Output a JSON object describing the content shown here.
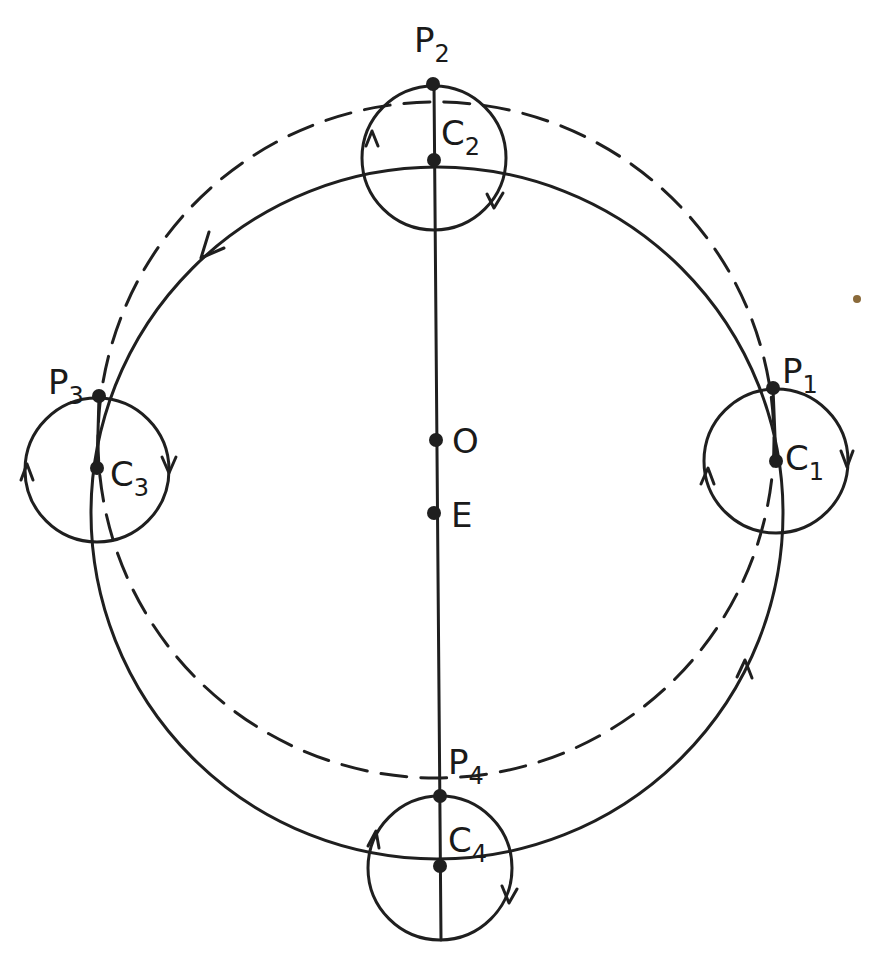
{
  "diagram": {
    "colors": {
      "ink": "#1f1f1f",
      "background": "#ffffff",
      "smudge": "#8a6a3a"
    },
    "points": {
      "O": {
        "label": "O",
        "x": 436,
        "y": 440
      },
      "E": {
        "label": "E",
        "x": 434,
        "y": 513
      }
    },
    "epicycles": [
      {
        "center_label": "C",
        "center_sub": "1",
        "planet_label": "P",
        "planet_sub": "1",
        "cx": 776,
        "cy": 461,
        "r": 72,
        "px": 773,
        "py": 388
      },
      {
        "center_label": "C",
        "center_sub": "2",
        "planet_label": "P",
        "planet_sub": "2",
        "cx": 434,
        "cy": 160,
        "r": 72,
        "px": 433,
        "py": 84
      },
      {
        "center_label": "C",
        "center_sub": "3",
        "planet_label": "P",
        "planet_sub": "3",
        "cx": 97,
        "cy": 468,
        "r": 72,
        "px": 99,
        "py": 396
      },
      {
        "center_label": "C",
        "center_sub": "4",
        "planet_label": "P",
        "planet_sub": "4",
        "cx": 440,
        "cy": 866,
        "r": 72,
        "px": 440,
        "py": 796
      }
    ],
    "deferent": {
      "cx": 437,
      "cy": 513,
      "r": 346,
      "style": "solid"
    },
    "planet_path": {
      "cx": 436,
      "cy": 440,
      "r": 338,
      "style": "dashed"
    }
  }
}
